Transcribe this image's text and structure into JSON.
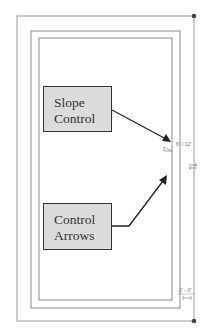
{
  "diagram": {
    "callouts": [
      {
        "id": "slope-control",
        "lines": [
          "Slope",
          "Control"
        ]
      },
      {
        "id": "control-arrows",
        "lines": [
          "Control",
          "Arrows"
        ]
      }
    ],
    "annotations": {
      "slope_label": "6\" / 12\"",
      "dimension_label": "2' - 0\"",
      "arrow_glyph": "⇄"
    },
    "colors": {
      "line": "#8a8a8a",
      "arrow": "#222222",
      "callout_fill": "#dcdcdc",
      "callout_border": "#333333",
      "grip": "#444444"
    }
  }
}
